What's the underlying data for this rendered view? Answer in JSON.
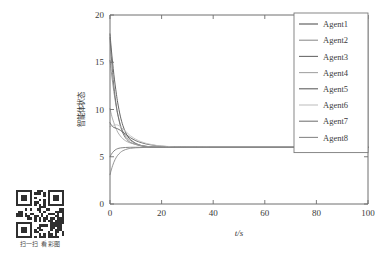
{
  "figure": {
    "background": "#ffffff",
    "axis_color": "#6e6e6e",
    "text_color": "#3b3b3b"
  },
  "qr": {
    "name": "qr-code",
    "caption": "扫一扫 看彩图",
    "modules": 21,
    "dark": "#2f2f2f"
  },
  "chart_data": {
    "type": "line",
    "title": "",
    "xlabel": "t/s",
    "ylabel": "智能体状态",
    "xlim": [
      0,
      100
    ],
    "ylim": [
      0,
      20
    ],
    "xticks": [
      0,
      20,
      40,
      60,
      80,
      100
    ],
    "yticks": [
      0,
      5,
      10,
      15,
      20
    ],
    "xticklabels": [
      "0",
      "20",
      "40",
      "60",
      "80",
      "100"
    ],
    "yticklabels": [
      "0",
      "5",
      "10",
      "15",
      "20"
    ],
    "grid": false,
    "legend_position": "upper right",
    "converged_value": 6,
    "x": [
      0,
      0.5,
      1,
      1.5,
      2,
      2.5,
      3,
      4,
      5,
      6,
      7,
      8,
      10,
      12,
      14,
      16,
      18,
      20,
      25,
      30,
      40,
      50,
      60,
      70,
      80,
      90,
      100
    ],
    "series": [
      {
        "name": "Agent1",
        "color": "#555555",
        "initial": 18.0,
        "values": [
          18.0,
          16.4,
          15.0,
          13.7,
          12.6,
          11.6,
          10.7,
          9.3,
          8.3,
          7.6,
          7.1,
          6.8,
          6.4,
          6.2,
          6.1,
          6.05,
          6.02,
          6.01,
          6.0,
          6.0,
          6.0,
          6.0,
          6.0,
          6.0,
          6.0,
          6.0,
          6.0
        ]
      },
      {
        "name": "Agent2",
        "color": "#8f8f8f",
        "initial": 15.2,
        "values": [
          15.2,
          14.0,
          12.9,
          11.9,
          11.0,
          10.2,
          9.5,
          8.4,
          7.7,
          7.2,
          6.9,
          6.7,
          6.4,
          6.2,
          6.1,
          6.05,
          6.02,
          6.01,
          6.0,
          6.0,
          6.0,
          6.0,
          6.0,
          6.0,
          6.0,
          6.0,
          6.0
        ]
      },
      {
        "name": "Agent3",
        "color": "#6b6b6b",
        "initial": 17.6,
        "values": [
          17.6,
          15.6,
          13.9,
          12.5,
          11.3,
          10.3,
          9.5,
          8.3,
          7.5,
          7.0,
          6.7,
          6.5,
          6.3,
          6.15,
          6.07,
          6.03,
          6.01,
          6.0,
          6.0,
          6.0,
          6.0,
          6.0,
          6.0,
          6.0,
          6.0,
          6.0,
          6.0
        ]
      },
      {
        "name": "Agent4",
        "color": "#a5a5a5",
        "initial": 10.1,
        "values": [
          10.1,
          9.5,
          9.0,
          8.6,
          8.2,
          7.9,
          7.6,
          7.2,
          6.9,
          6.7,
          6.55,
          6.45,
          6.3,
          6.18,
          6.1,
          6.06,
          6.03,
          6.01,
          6.0,
          6.0,
          6.0,
          6.0,
          6.0,
          6.0,
          6.0,
          6.0,
          6.0
        ]
      },
      {
        "name": "Agent5",
        "color": "#5f5f5f",
        "initial": 8.6,
        "values": [
          8.6,
          8.35,
          8.2,
          8.1,
          8.05,
          8.0,
          7.95,
          7.8,
          7.6,
          7.4,
          7.2,
          7.0,
          6.7,
          6.5,
          6.35,
          6.25,
          6.18,
          6.12,
          6.04,
          6.01,
          6.0,
          6.0,
          6.0,
          6.0,
          6.0,
          6.0,
          6.0
        ]
      },
      {
        "name": "Agent6",
        "color": "#c2c2c2",
        "initial": 8.2,
        "values": [
          8.2,
          8.25,
          8.3,
          8.35,
          8.38,
          8.38,
          8.35,
          8.2,
          7.95,
          7.7,
          7.45,
          7.2,
          6.85,
          6.6,
          6.42,
          6.3,
          6.2,
          6.14,
          6.05,
          6.01,
          6.0,
          6.0,
          6.0,
          6.0,
          6.0,
          6.0,
          6.0
        ]
      },
      {
        "name": "Agent7",
        "color": "#777777",
        "initial": 5.0,
        "values": [
          5.0,
          5.25,
          5.45,
          5.6,
          5.72,
          5.8,
          5.86,
          5.93,
          5.96,
          5.98,
          5.99,
          6.0,
          6.0,
          6.0,
          6.0,
          6.0,
          6.0,
          6.0,
          6.0,
          6.0,
          6.0,
          6.0,
          6.0,
          6.0,
          6.0,
          6.0,
          6.0
        ]
      },
      {
        "name": "Agent8",
        "color": "#8a8a8a",
        "initial": 3.1,
        "values": [
          3.1,
          3.6,
          4.05,
          4.42,
          4.72,
          4.96,
          5.16,
          5.45,
          5.64,
          5.76,
          5.84,
          5.89,
          5.95,
          5.97,
          5.99,
          5.99,
          6.0,
          6.0,
          6.0,
          6.0,
          6.0,
          6.0,
          6.0,
          6.0,
          6.0,
          6.0,
          6.0
        ]
      }
    ]
  }
}
